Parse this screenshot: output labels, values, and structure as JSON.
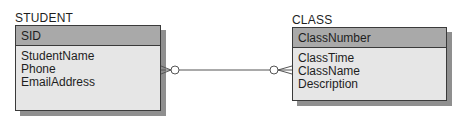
{
  "diagram": {
    "type": "er-diagram",
    "entities": [
      {
        "name": "STUDENT",
        "key": "SID",
        "attributes": [
          "StudentName",
          "Phone",
          "EmailAddress"
        ]
      },
      {
        "name": "CLASS",
        "key": "ClassNumber",
        "attributes": [
          "ClassTime",
          "ClassName",
          "Description"
        ]
      }
    ],
    "relationships": [
      {
        "from": "STUDENT",
        "to": "CLASS",
        "from_cardinality": "zero-or-many",
        "to_cardinality": "zero-or-many"
      }
    ]
  },
  "colors": {
    "key_header": "#a9a9a9",
    "body": "#e6e6e6",
    "shadow": "#8f8f8f",
    "border": "#3a3a3a"
  }
}
